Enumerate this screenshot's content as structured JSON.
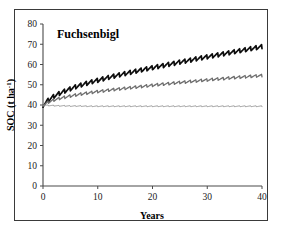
{
  "figure": {
    "panel_label": "Fuchsenbigl",
    "border_color": "#3a3a3a",
    "background": "#ffffff"
  },
  "chart_data": {
    "type": "line",
    "title": "Fuchsenbigl",
    "xlabel": "Years",
    "ylabel": "SOC (t ha-1)",
    "ylabel_display": "SOC (t ha",
    "ylabel_super": "-1",
    "ylabel_tail": ")",
    "xlim": [
      0,
      40
    ],
    "ylim": [
      0,
      80
    ],
    "xticks": [
      0,
      10,
      20,
      30,
      40
    ],
    "yticks": [
      0,
      10,
      20,
      30,
      40,
      50,
      60,
      70,
      80
    ],
    "xtick_labels": [
      "0",
      "10",
      "20",
      "30",
      "40"
    ],
    "ytick_labels": [
      "0",
      "10",
      "20",
      "30",
      "40",
      "50",
      "60",
      "70",
      "80"
    ],
    "grid": false,
    "legend": "none",
    "oscillation": {
      "present": true,
      "description": "annual seasonal sawtooth superimposed on each trend",
      "period_years": 1,
      "amplitude_top": 1.1,
      "amplitude_middle": 0.7,
      "amplitude_bottom": 0.25
    },
    "x": [
      0,
      1,
      2,
      3,
      4,
      5,
      6,
      7,
      8,
      9,
      10,
      11,
      12,
      13,
      14,
      15,
      16,
      17,
      18,
      19,
      20,
      21,
      22,
      23,
      24,
      25,
      26,
      27,
      28,
      29,
      30,
      31,
      32,
      33,
      34,
      35,
      36,
      37,
      38,
      39,
      40
    ],
    "series": [
      {
        "name": "high-input treatment",
        "color": "#0d0d0d",
        "width": 1.7,
        "values": [
          40.0,
          42.6,
          44.4,
          45.8,
          47.0,
          48.1,
          49.1,
          50.0,
          50.8,
          51.6,
          52.3,
          53.0,
          53.7,
          54.4,
          55.0,
          55.6,
          56.2,
          56.8,
          57.4,
          58.0,
          58.5,
          59.1,
          59.6,
          60.2,
          60.7,
          61.3,
          61.8,
          62.3,
          62.9,
          63.4,
          63.9,
          64.4,
          64.9,
          65.4,
          65.9,
          66.4,
          66.9,
          67.4,
          67.9,
          68.4,
          68.9
        ],
        "end_value": 68.9
      },
      {
        "name": "medium-input treatment",
        "color": "#6e6e6e",
        "width": 1.3,
        "values": [
          40.0,
          41.5,
          42.5,
          43.3,
          43.9,
          44.5,
          45.0,
          45.5,
          45.9,
          46.3,
          46.7,
          47.0,
          47.4,
          47.7,
          48.0,
          48.3,
          48.6,
          48.9,
          49.2,
          49.5,
          49.8,
          50.1,
          50.4,
          50.6,
          50.9,
          51.2,
          51.4,
          51.7,
          51.9,
          52.2,
          52.4,
          52.7,
          52.9,
          53.1,
          53.4,
          53.6,
          53.8,
          54.0,
          54.2,
          54.4,
          54.6
        ],
        "end_value": 54.6
      },
      {
        "name": "control / no-input treatment",
        "color": "#8c8c8c",
        "width": 0.9,
        "values": [
          40.0,
          39.8,
          39.7,
          39.6,
          39.6,
          39.5,
          39.5,
          39.5,
          39.4,
          39.4,
          39.4,
          39.4,
          39.4,
          39.4,
          39.4,
          39.4,
          39.4,
          39.4,
          39.4,
          39.4,
          39.4,
          39.4,
          39.4,
          39.4,
          39.4,
          39.4,
          39.4,
          39.4,
          39.4,
          39.4,
          39.4,
          39.4,
          39.4,
          39.4,
          39.4,
          39.4,
          39.4,
          39.4,
          39.4,
          39.4,
          39.4
        ],
        "end_value": 39.4
      }
    ]
  },
  "plot_geometry": {
    "left_px": 43,
    "right_px": 262,
    "bottom_px": 186,
    "top_px": 24
  }
}
